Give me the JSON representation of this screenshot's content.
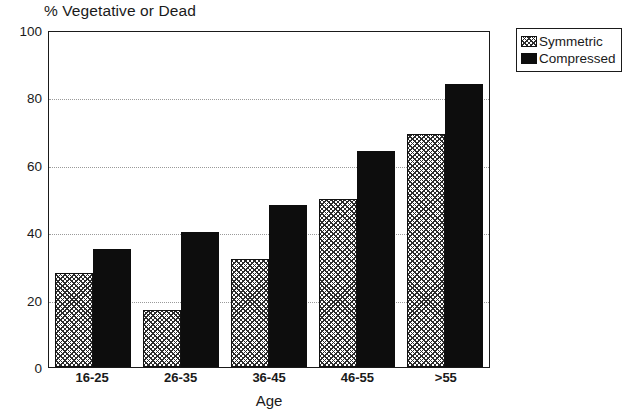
{
  "chart_data": {
    "type": "bar",
    "title": "% Vegetative or Dead",
    "xlabel": "Age",
    "ylabel": "",
    "categories": [
      "16-25",
      "26-35",
      "36-45",
      "46-55",
      ">55"
    ],
    "series": [
      {
        "name": "Symmetric",
        "values": [
          28,
          17,
          32,
          50,
          69
        ]
      },
      {
        "name": "Compressed",
        "values": [
          35,
          40,
          48,
          64,
          84
        ]
      }
    ],
    "ylim": [
      0,
      100
    ],
    "yticks": [
      0,
      20,
      40,
      60,
      80,
      100
    ],
    "ytick_labels": [
      "0",
      "20",
      "40",
      "60",
      "80",
      "100"
    ],
    "grid": "horizontal-dotted",
    "legend_position": "top-right-outside",
    "colors": {
      "symmetric_fill": "#ffffff",
      "symmetric_hatch": "#2b2b2b",
      "compressed_fill": "#0d0d0d",
      "axis": "#1a1a1a",
      "grid": "#9a9a9a",
      "background": "#ffffff"
    }
  },
  "legend": {
    "items": [
      {
        "label": "Symmetric",
        "pattern": "crosshatch"
      },
      {
        "label": "Compressed",
        "pattern": "solid"
      }
    ]
  }
}
